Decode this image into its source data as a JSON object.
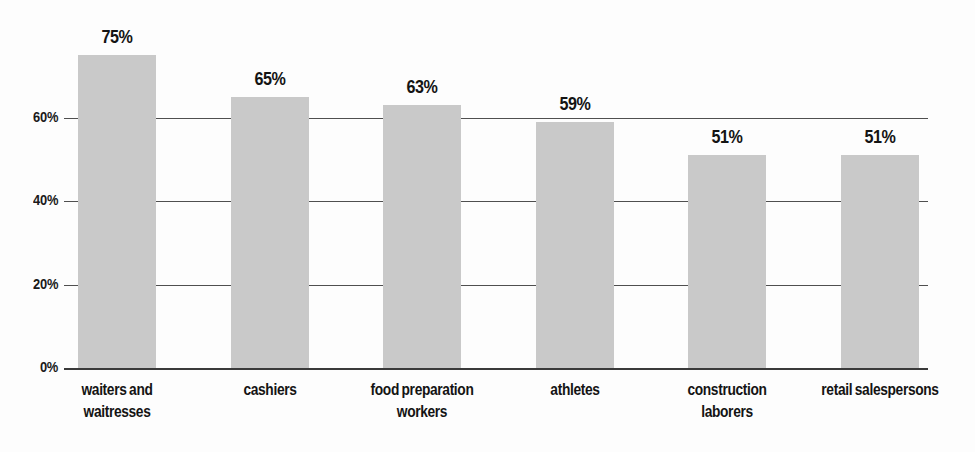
{
  "chart_data": {
    "type": "bar",
    "title": "",
    "subtitle": "",
    "xlabel": "",
    "ylabel": "",
    "ylim": [
      0,
      80
    ],
    "grid": true,
    "legend": "none",
    "orientation": "vertical",
    "value_suffix": "%",
    "categories": [
      "waiters and waitresses",
      "cashiers",
      "food preparation workers",
      "athletes",
      "construction laborers",
      "retail salespersons"
    ],
    "category_lines": [
      [
        "waiters and",
        "waitresses"
      ],
      [
        "cashiers"
      ],
      [
        "food preparation",
        "workers"
      ],
      [
        "athletes"
      ],
      [
        "construction",
        "laborers"
      ],
      [
        "retail salespersons"
      ]
    ],
    "values": [
      75,
      65,
      63,
      59,
      51,
      51
    ],
    "value_labels": [
      "75%",
      "65%",
      "63%",
      "59%",
      "51%",
      "51%"
    ],
    "yticks": [
      0,
      20,
      40,
      60
    ],
    "ytick_labels": [
      "0%",
      "20%",
      "40%",
      "60%"
    ],
    "bar_color": "#c9c9c9",
    "gridline_color": "#4f4f4f",
    "text_color": "#141414",
    "background_color": "#fdfdfd"
  },
  "geometry": {
    "plot_left": 64,
    "plot_right": 928,
    "baseline_y": 368,
    "top_y": 35,
    "bar_width": 78,
    "bar_step": 152.5,
    "first_bar_x": 78,
    "px_per_percent": 4.175
  }
}
